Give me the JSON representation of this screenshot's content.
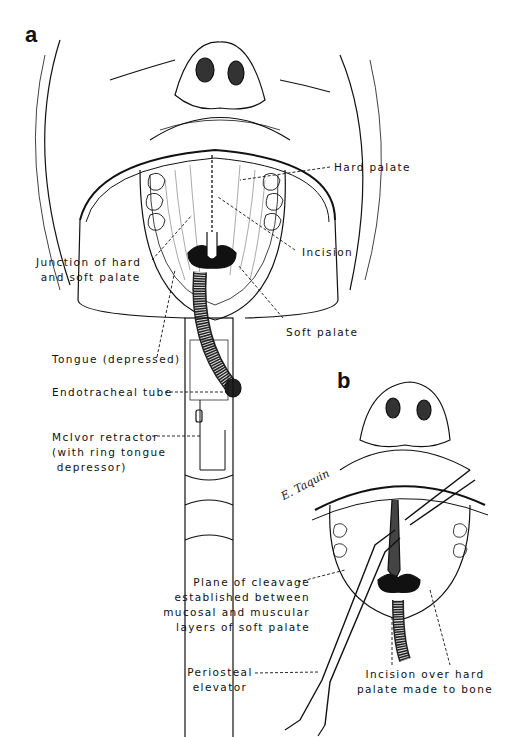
{
  "figure": {
    "panels": [
      {
        "letter": "a",
        "labels": {
          "hard_palate": "Hard palate",
          "incision": "Incision",
          "junction": "Junction of hard\n and soft palate",
          "soft_palate": "Soft palate",
          "tongue": "Tongue (depressed)",
          "endotracheal_tube": "Endotracheal tube",
          "mcivor_retractor": "McIvor retractor\n(with ring tongue\n depressor)"
        }
      },
      {
        "letter": "b",
        "labels": {
          "plane_of_cleavage": "Plane of cleavage\nestablished between\nmucosal and muscular\nlayers of soft palate",
          "periosteal_elevator": "Periosteal\nelevator",
          "incision_over_hard_palate": "Incision over hard\npalate made to bone"
        }
      }
    ],
    "signature": "E. Taquin"
  },
  "colors": {
    "ink": "#111111",
    "background": "#ffffff"
  }
}
